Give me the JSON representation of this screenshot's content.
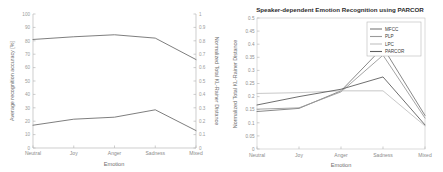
{
  "figure": {
    "name": "emotion-recognition-figure",
    "panel_count": 2,
    "background_color": "#ffffff"
  },
  "chart_data": [
    {
      "panel": "left",
      "type": "line",
      "title": "",
      "xlabel": "Emotion",
      "ylabel": "Average recognition accuracy [%]",
      "y2label": "Normalized Total KL-Rainer Distance",
      "categories": [
        "Neutral",
        "Joy",
        "Anger",
        "Sadness",
        "Mixed"
      ],
      "ylim": [
        0,
        100
      ],
      "yticks": [
        0,
        10,
        20,
        30,
        40,
        50,
        60,
        70,
        80,
        90,
        100
      ],
      "y2lim": [
        0,
        1
      ],
      "y2ticks": [
        0,
        0.1,
        0.2,
        0.3,
        0.4,
        0.5,
        0.6,
        0.7,
        0.8,
        0.9,
        1
      ],
      "grid": false,
      "legend": "none",
      "series": [
        {
          "name": "Average recognition accuracy",
          "axis": "left",
          "color": "#6f6f6f",
          "values": [
            81,
            83,
            84.5,
            82,
            66
          ]
        },
        {
          "name": "Normalized Total KL-Rainer Distance",
          "axis": "right",
          "color": "#6f6f6f",
          "values": [
            0.17,
            0.215,
            0.23,
            0.285,
            0.13
          ]
        }
      ]
    },
    {
      "panel": "right",
      "type": "line",
      "title": "Speaker-dependent Emotion Recognition using PARCOR",
      "xlabel": "Emotion",
      "ylabel": "Normalized Total KL-Rainer Distance",
      "categories": [
        "Neutral",
        "Joy",
        "Anger",
        "Sadness",
        "Mixed"
      ],
      "ylim": [
        0,
        0.5
      ],
      "yticks": [
        0,
        0.05,
        0.1,
        0.15,
        0.2,
        0.25,
        0.3,
        0.35,
        0.4,
        0.45,
        0.5
      ],
      "grid": false,
      "legend": "upper right",
      "series": [
        {
          "name": "MFCC",
          "color": "#7a7a7a",
          "values": [
            0.143,
            0.155,
            0.222,
            0.388,
            0.128
          ]
        },
        {
          "name": "PLP",
          "color": "#9a9a9a",
          "values": [
            0.152,
            0.157,
            0.218,
            0.358,
            0.118
          ]
        },
        {
          "name": "LPC",
          "color": "#c2c2c2",
          "values": [
            0.212,
            0.215,
            0.222,
            0.222,
            0.088
          ]
        },
        {
          "name": "PARCOR",
          "color": "#5f5f5f",
          "values": [
            0.168,
            0.2,
            0.228,
            0.275,
            0.092
          ]
        }
      ]
    }
  ],
  "left_panel": {
    "xlabel": "Emotion",
    "ylabel_left": "Average recognition accuracy [%]",
    "ylabel_right": "Normalized Total KL-Rainer Distance",
    "xticklabels": [
      "Neutral",
      "Joy",
      "Anger",
      "Sadness",
      "Mixed"
    ],
    "yticklabels_left": [
      "0",
      "10",
      "20",
      "30",
      "40",
      "50",
      "60",
      "70",
      "80",
      "90",
      "100"
    ],
    "yticklabels_right": [
      "0",
      "0.1",
      "0.2",
      "0.3",
      "0.4",
      "0.5",
      "0.6",
      "0.7",
      "0.8",
      "0.9",
      "1"
    ]
  },
  "right_panel": {
    "title": "Speaker-dependent Emotion Recognition using PARCOR",
    "xlabel": "Emotion",
    "ylabel": "Normalized Total KL-Rainer Distance",
    "xticklabels": [
      "Neutral",
      "Joy",
      "Anger",
      "Sadness",
      "Mixed"
    ],
    "yticklabels": [
      "0",
      "0.05",
      "0.1",
      "0.15",
      "0.2",
      "0.25",
      "0.3",
      "0.35",
      "0.4",
      "0.45",
      "0.5"
    ],
    "legend": {
      "entries": [
        {
          "label": "MFCC",
          "color": "#7a7a7a"
        },
        {
          "label": "PLP",
          "color": "#9a9a9a"
        },
        {
          "label": "LPC",
          "color": "#c2c2c2"
        },
        {
          "label": "PARCOR",
          "color": "#5f5f5f"
        }
      ]
    }
  }
}
